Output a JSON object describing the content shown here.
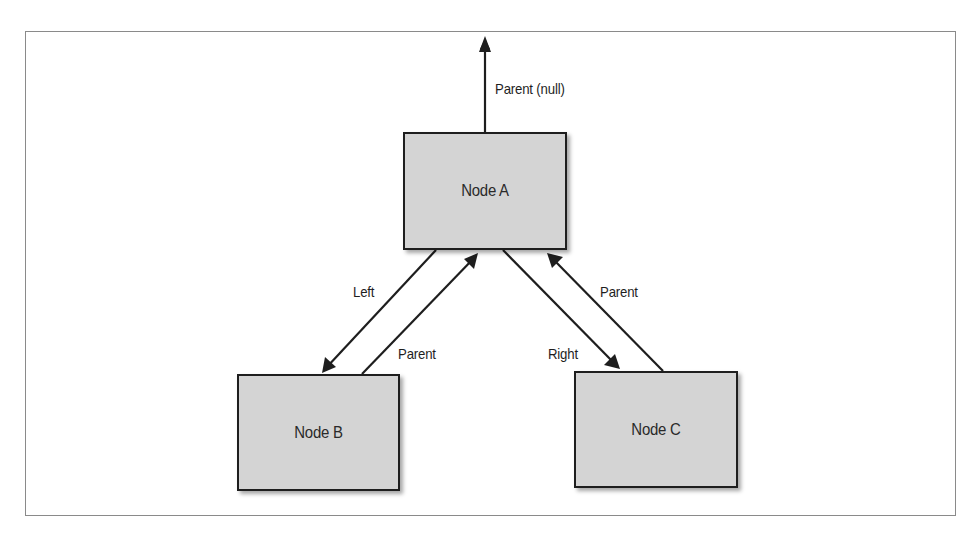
{
  "diagram": {
    "type": "binary-tree-node-pointers",
    "colors": {
      "node_fill": "#d4d4d4",
      "node_border": "#1e1e1e",
      "arrow": "#1e1e1e",
      "frame": "#8a8a8a"
    },
    "nodes": [
      {
        "id": "A",
        "label": "Node A"
      },
      {
        "id": "B",
        "label": "Node B"
      },
      {
        "id": "C",
        "label": "Node C"
      }
    ],
    "edges": [
      {
        "from": "A",
        "to": "null",
        "label": "Parent (null)"
      },
      {
        "from": "A",
        "to": "B",
        "label": "Left"
      },
      {
        "from": "B",
        "to": "A",
        "label": "Parent"
      },
      {
        "from": "A",
        "to": "C",
        "label": "Right"
      },
      {
        "from": "C",
        "to": "A",
        "label": "Parent"
      }
    ]
  }
}
